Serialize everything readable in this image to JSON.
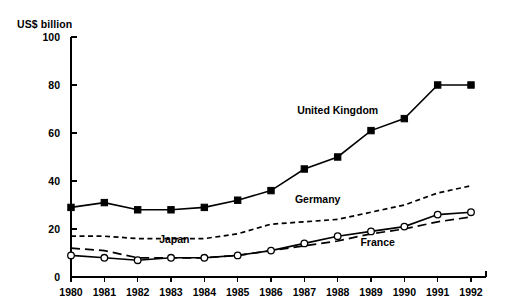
{
  "chart_data": {
    "type": "line",
    "title": "",
    "subtitle": "",
    "xlabel": "",
    "ylabel": "US$ billion",
    "ylim": [
      0,
      100
    ],
    "yticks": [
      0,
      20,
      40,
      60,
      80,
      100
    ],
    "grid": false,
    "legend_position": "inline-annotations",
    "categories": [
      "1980",
      "1981",
      "1982",
      "1983",
      "1984",
      "1985",
      "1986",
      "1987",
      "1988",
      "1989",
      "1990",
      "1991",
      "1992"
    ],
    "x": [
      1980,
      1981,
      1982,
      1983,
      1984,
      1985,
      1986,
      1987,
      1988,
      1989,
      1990,
      1991,
      1992
    ],
    "series": [
      {
        "name": "United Kingdom",
        "marker": "filled-square",
        "line_style": "solid",
        "color": "#000000",
        "values": [
          29,
          31,
          28,
          28,
          29,
          32,
          36,
          45,
          50,
          61,
          66,
          80,
          80
        ]
      },
      {
        "name": "Germany",
        "marker": "none",
        "line_style": "dotted",
        "color": "#000000",
        "values": [
          17,
          17,
          16,
          16,
          16,
          18,
          22,
          23,
          24,
          27,
          30,
          35,
          38
        ]
      },
      {
        "name": "Japan",
        "marker": "open-circle",
        "line_style": "solid",
        "color": "#000000",
        "values": [
          9,
          8,
          7,
          8,
          8,
          9,
          11,
          14,
          17,
          19,
          21,
          26,
          27
        ]
      },
      {
        "name": "France",
        "marker": "none",
        "line_style": "dashed",
        "color": "#000000",
        "values": [
          12,
          11,
          8,
          8,
          8,
          9,
          11,
          13,
          15,
          18,
          20,
          23,
          25
        ]
      }
    ],
    "annotations": [
      {
        "text": "United Kingdom",
        "x": 1988,
        "y": 68
      },
      {
        "text": "Germany",
        "x": 1987.4,
        "y": 31
      },
      {
        "text": "Japan",
        "x": 1983.1,
        "y": 14
      },
      {
        "text": "France",
        "x": 1989.2,
        "y": 13
      }
    ]
  },
  "axis": {
    "unit_label": "US$ billion"
  }
}
